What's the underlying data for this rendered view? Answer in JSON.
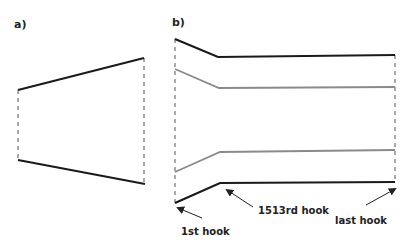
{
  "panels": {
    "a": {
      "label": "a)",
      "top_line": [
        [
          18,
          90
        ],
        [
          144,
          58
        ]
      ],
      "bottom_line": [
        [
          18,
          160
        ],
        [
          145,
          184
        ]
      ],
      "left_dashed": [
        [
          18,
          90
        ],
        [
          18,
          160
        ]
      ],
      "right_dashed": [
        [
          144,
          58
        ],
        [
          144,
          184
        ]
      ]
    },
    "b": {
      "label": "b)",
      "left_dashed": [
        [
          175,
          39
        ],
        [
          175,
          203
        ]
      ],
      "right_dashed": [
        [
          395,
          55
        ],
        [
          395,
          182
        ]
      ],
      "outer_top": [
        [
          175,
          39
        ],
        [
          218,
          57
        ],
        [
          395,
          55
        ]
      ],
      "inner_top": [
        [
          175,
          69
        ],
        [
          219,
          88
        ],
        [
          395,
          87
        ]
      ],
      "inner_bottom": [
        [
          175,
          172
        ],
        [
          220,
          152
        ],
        [
          395,
          150
        ]
      ],
      "outer_bottom": [
        [
          175,
          203
        ],
        [
          220,
          183
        ],
        [
          395,
          182
        ]
      ],
      "annotations": [
        {
          "text": "1st hook",
          "text_pos": [
            181,
            235
          ],
          "arrow_from": [
            202,
            218
          ],
          "arrow_to": [
            178,
            208
          ]
        },
        {
          "text": "1513rd hook",
          "text_pos": [
            258,
            214
          ],
          "arrow_from": [
            253,
            207
          ],
          "arrow_to": [
            227,
            190
          ]
        },
        {
          "text": "last hook",
          "text_pos": [
            335,
            224
          ],
          "arrow_from": [
            366,
            205
          ],
          "arrow_to": [
            395,
            189
          ]
        }
      ]
    }
  },
  "colors": {
    "outer_line": "#1a1a1a",
    "inner_line": "#8a8a8a",
    "dashed": "#555555",
    "text": "#222222"
  }
}
